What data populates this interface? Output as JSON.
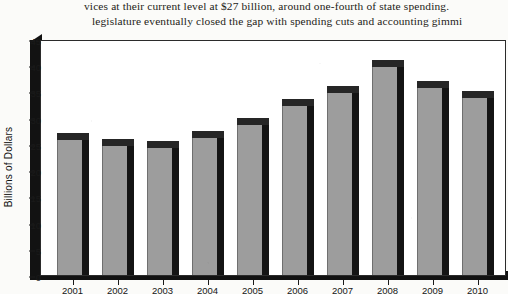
{
  "page": {
    "body_text": {
      "line1": "vices at their current level at $27 billion, around one-fourth of state spending. ",
      "line2": "legislature eventually closed the gap with spending cuts and accounting gimmi"
    }
  },
  "chart_data": {
    "type": "bar",
    "title": "",
    "xlabel": "",
    "ylabel": "Billions of Dollars",
    "categories": [
      "2001",
      "2002",
      "2003",
      "2004",
      "2005",
      "2006",
      "2007",
      "2008",
      "2009",
      "2010"
    ],
    "values": [
      27,
      26,
      25.5,
      27.5,
      30,
      33.5,
      36,
      41,
      37,
      35
    ],
    "ylim": [
      0,
      45
    ],
    "yticks": [
      0,
      5,
      10,
      15,
      20,
      25,
      30,
      35,
      40,
      45
    ],
    "ytick_labels": [
      "0",
      "5",
      "10",
      "15",
      "20",
      "25",
      "30",
      "35",
      "40",
      "45"
    ],
    "grid": false,
    "legend": null,
    "style": "3d-bar",
    "colors": {
      "bar_face": "#9d9d9d",
      "bar_shade": "#141414",
      "bar_top": "#262626",
      "axis": "#121212",
      "plot_background": "#ffffff",
      "page_background": "#fbfbf9",
      "text": "#151515"
    }
  }
}
